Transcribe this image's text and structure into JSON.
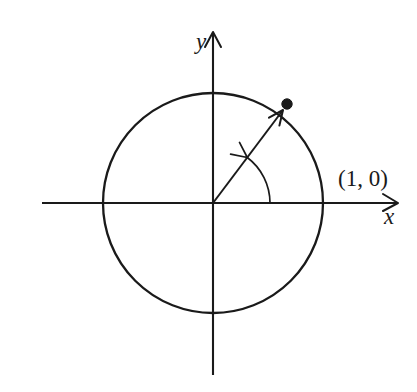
{
  "figure": {
    "name": "unit-circle-with-terminal-point",
    "background_color": "#ffffff",
    "ink_color": "#1a1a1a",
    "width": 417,
    "height": 392
  },
  "labels": {
    "y_axis": "y",
    "x_axis": "x",
    "point_on_x_axis": "(1, 0)"
  },
  "chart_data": {
    "type": "scatter",
    "title": "",
    "subtitle": "",
    "xlabel": "x",
    "ylabel": "y",
    "grid": false,
    "legend": "none",
    "axis_style": "arrowed-cartesian-axes-through-origin",
    "origin_px": {
      "x": 213,
      "y": 203
    },
    "px_per_unit": 110,
    "xlim": [
      -1.555,
      1.682
    ],
    "ylim": [
      -1.564,
      1.555
    ],
    "x_axis_px": {
      "x_start": 42,
      "x_end": 398,
      "y": 203,
      "arrow_at": "right"
    },
    "y_axis_px": {
      "y_start": 375,
      "y_end": 32,
      "x": 213,
      "arrow_at": "top"
    },
    "series": [
      {
        "name": "unit circle",
        "type": "circle",
        "center": [
          0,
          0
        ],
        "radius": 1,
        "center_px": [
          213,
          203
        ],
        "radius_px": 110,
        "extrema_px": {
          "left": 103,
          "right": 323,
          "top": 88,
          "bottom": 318
        }
      },
      {
        "name": "terminal point",
        "type": "point",
        "values": [
          [
            0.673,
            0.9
          ]
        ],
        "point_px": [
          287,
          104
        ],
        "marker": "filled-circle",
        "marker_radius_px": 5.2,
        "label": ""
      },
      {
        "name": "radius vector",
        "type": "arrow",
        "from": [
          0,
          0
        ],
        "to": [
          0.636,
          0.845
        ],
        "from_px": [
          213,
          203
        ],
        "to_px": [
          283,
          110
        ],
        "angle_deg": 53
      },
      {
        "name": "angle arc",
        "type": "arc",
        "center": [
          0,
          0
        ],
        "radius_px": 57,
        "start_angle_deg": 0,
        "end_angle_deg": 53,
        "sweep_direction": "counterclockwise",
        "arrow_at": "end",
        "start_px": [
          270,
          203
        ],
        "end_px": [
          247,
          157
        ]
      },
      {
        "name": "x-intercept label",
        "type": "annotation",
        "text": "(1, 0)",
        "values": [
          [
            1,
            0
          ]
        ],
        "anchor_px": [
          323,
          203
        ],
        "label_px": [
          338,
          167
        ]
      }
    ]
  }
}
